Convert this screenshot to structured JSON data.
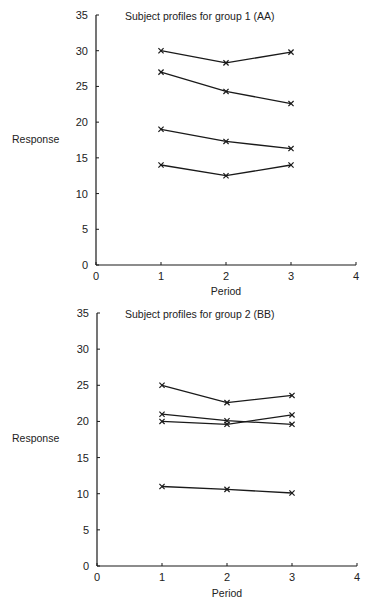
{
  "chart_data": [
    {
      "type": "line",
      "title": "Subject profiles for group 1 (AA)",
      "xlabel": "Period",
      "ylabel": "Response",
      "x": [
        1,
        2,
        3
      ],
      "xlim": [
        0,
        4
      ],
      "ylim": [
        0,
        35
      ],
      "xticks": [
        "0",
        "1",
        "2",
        "3",
        "4"
      ],
      "yticks": [
        "0",
        "5",
        "10",
        "15",
        "20",
        "25",
        "30",
        "35"
      ],
      "grid": false,
      "legend": null,
      "marker": "x",
      "series": [
        {
          "name": "Subject 1",
          "values": [
            30.0,
            28.3,
            29.8
          ]
        },
        {
          "name": "Subject 2",
          "values": [
            27.0,
            24.3,
            22.6
          ]
        },
        {
          "name": "Subject 3",
          "values": [
            19.0,
            17.3,
            16.3
          ]
        },
        {
          "name": "Subject 4",
          "values": [
            14.0,
            12.5,
            14.0
          ]
        }
      ]
    },
    {
      "type": "line",
      "title": "Subject profiles for group 2 (BB)",
      "xlabel": "Period",
      "ylabel": "Response",
      "x": [
        1,
        2,
        3
      ],
      "xlim": [
        0,
        4
      ],
      "ylim": [
        0,
        35
      ],
      "xticks": [
        "0",
        "1",
        "2",
        "3",
        "4"
      ],
      "yticks": [
        "0",
        "5",
        "10",
        "15",
        "20",
        "25",
        "30",
        "35"
      ],
      "grid": false,
      "legend": null,
      "marker": "x",
      "series": [
        {
          "name": "Subject 1",
          "values": [
            25.0,
            22.6,
            23.6
          ]
        },
        {
          "name": "Subject 2",
          "values": [
            21.0,
            20.1,
            19.6
          ]
        },
        {
          "name": "Subject 3",
          "values": [
            20.0,
            19.6,
            20.9
          ]
        },
        {
          "name": "Subject 4",
          "values": [
            11.0,
            10.6,
            10.1
          ]
        }
      ]
    }
  ],
  "style": {
    "line_color": "#1a1a1a",
    "text_color": "#222222",
    "background": "#ffffff"
  }
}
